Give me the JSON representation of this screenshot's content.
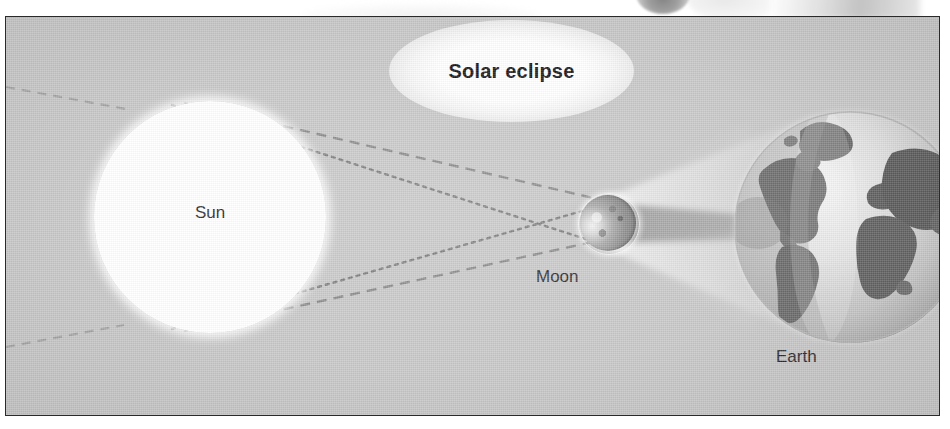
{
  "figure": {
    "title": "Solar eclipse",
    "kind": "astronomy-diagram",
    "caption_labels": {
      "sun": "Sun",
      "moon": "Moon",
      "earth": "Earth"
    },
    "colors": {
      "panel_background": "#c8c8c8",
      "panel_border": "#2a2a2a",
      "sun_body": "#ffffff",
      "moon_body": "#8a8a8a",
      "moon_lit_crescent": "#f2f2f2",
      "earth_ocean": "#d8d8d8",
      "earth_land": "#5f5f5f",
      "shadow_umbra": "#9a9a9a",
      "shadow_penumbra": "#d6d6d6",
      "ray_line": "#7e7e7e",
      "label_text": "#2b2b2b",
      "title_text": "#161616",
      "title_glow": "#ffffff"
    },
    "bodies": [
      {
        "name": "Sun",
        "cx": 204,
        "cy": 200,
        "r": 116,
        "fill": "#ffffff"
      },
      {
        "name": "Moon",
        "cx": 602,
        "cy": 206,
        "r": 28,
        "fill": "#8a8a8a"
      },
      {
        "name": "Earth",
        "cx": 844,
        "cy": 210,
        "r": 116,
        "fill": "#d8d8d8"
      }
    ],
    "light_rays": [
      {
        "id": "ray-top-outer",
        "from": "sun-top-edge",
        "to": "moon-bottom-edge",
        "style": "dotted"
      },
      {
        "id": "ray-top-inner",
        "from": "sun-top-edge",
        "to": "moon-top-edge",
        "style": "dashed"
      },
      {
        "id": "ray-bottom-inner",
        "from": "sun-bottom-edge",
        "to": "moon-bottom-edge",
        "style": "dashed"
      },
      {
        "id": "ray-bottom-outer",
        "from": "sun-bottom-edge",
        "to": "moon-top-edge",
        "style": "dotted"
      }
    ],
    "shadow_cones": [
      {
        "id": "umbra",
        "label": "umbra",
        "from": "Moon",
        "to": "Earth",
        "tone": "dark"
      },
      {
        "id": "penumbra",
        "label": "penumbra",
        "from": "Moon",
        "to": "Earth",
        "tone": "light"
      }
    ]
  }
}
